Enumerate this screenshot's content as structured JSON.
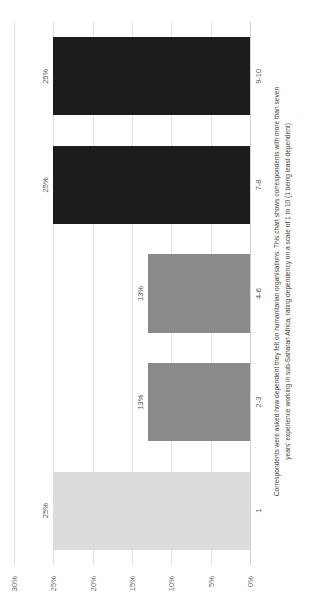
{
  "chart_data": {
    "type": "bar",
    "title": "",
    "subtitle": "",
    "xlabel": "",
    "ylabel": "",
    "categories": [
      "1",
      "2-3",
      "4-6",
      "7-8",
      "9-10"
    ],
    "values": [
      25,
      13,
      13,
      25,
      25
    ],
    "value_labels": [
      "25%",
      "13%",
      "13%",
      "25%",
      "25%"
    ],
    "bar_colors": [
      "#dcdcdc",
      "#8a8a8a",
      "#8a8a8a",
      "#1c1c1c",
      "#1c1c1c"
    ],
    "ylim": [
      0,
      30
    ],
    "ytick_values": [
      30,
      25,
      20,
      15,
      10,
      5,
      0
    ],
    "ytick_labels": [
      "30%",
      "25%",
      "20%",
      "15%",
      "10%",
      "5%",
      "0%"
    ],
    "grid": true,
    "grid_color": "#e2e2e2",
    "legend": "none",
    "orientation": "vertical",
    "rotation_in_image_degrees": -90,
    "annotation": "Correspondents were asked how dependent they felt on humanitarian organisations. This chart shows correspondents with more than seven years' experience working in sub-Saharan Africa, rating dependency on a scale of 1 to 10 (1 being least dependent)"
  },
  "caption": {
    "line1": "Correspondents were asked how dependent they felt on humanitarian organisations. This chart shows correspondents with more than seven",
    "line2": "years' experience working in sub-Saharan Africa, rating dependency on a scale of 1 to 10 (1 being least dependent)"
  }
}
